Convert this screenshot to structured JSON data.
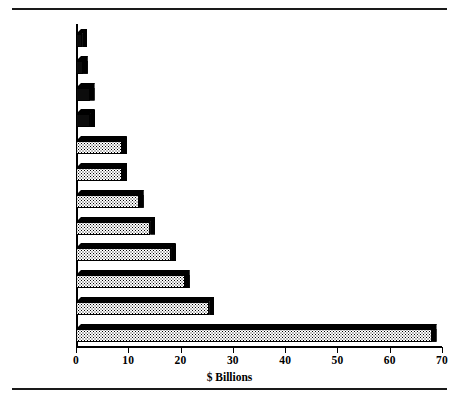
{
  "figure": {
    "has_top_rule": true,
    "has_bottom_rule": true,
    "ink_color": "#000000",
    "background_color": "#ffffff"
  },
  "axis": {
    "x_label": "$ Billions",
    "x_ticks": [
      0,
      10,
      20,
      30,
      40,
      50,
      60,
      70
    ],
    "x_tick_labels": [
      "0",
      "10",
      "20",
      "30",
      "40",
      "50",
      "60",
      "70"
    ],
    "x_min": 0,
    "x_max": 70
  },
  "chart_data": {
    "type": "bar",
    "orientation": "horizontal",
    "title": "",
    "subtitle": "",
    "xlabel": "$ Billions",
    "ylabel": "",
    "xlim": [
      0,
      70
    ],
    "grid": false,
    "legend": false,
    "style": "3d-shaded-stipple",
    "categories": [
      "Greece",
      "Portugal",
      "Luxembourg",
      "Denmark",
      "Spain",
      "Ireland",
      "Belgium",
      "Italy",
      "France",
      "Netherlands",
      "West Germany",
      "UK"
    ],
    "values": [
      1.2,
      1.3,
      2.6,
      2.7,
      8.8,
      8.8,
      12.0,
      14.2,
      18.2,
      20.8,
      25.5,
      68.0
    ],
    "value_unit": "$ Billions"
  }
}
